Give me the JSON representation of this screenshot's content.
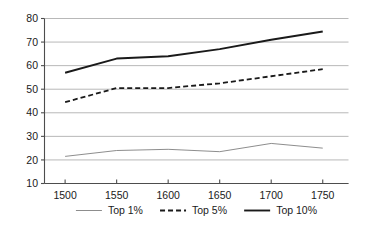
{
  "chart_data": {
    "type": "line",
    "title": "",
    "subtitle": "",
    "xlabel": "",
    "ylabel": "",
    "x": [
      1500,
      1550,
      1600,
      1650,
      1700,
      1750
    ],
    "categories": [
      "1500",
      "1550",
      "1600",
      "1650",
      "1700",
      "1750"
    ],
    "xlim": [
      1480,
      1775
    ],
    "ylim": [
      10,
      80
    ],
    "yticks": [
      10,
      20,
      30,
      40,
      50,
      60,
      70,
      80
    ],
    "ytick_labels": [
      "10",
      "20",
      "30",
      "40",
      "50",
      "60",
      "70",
      "80"
    ],
    "xticks": [
      1500,
      1550,
      1600,
      1650,
      1700,
      1750
    ],
    "xtick_labels": [
      "1500",
      "1550",
      "1600",
      "1650",
      "1700",
      "1750"
    ],
    "grid": "horizontal",
    "legend_position": "bottom",
    "series": [
      {
        "name": "Top 1%",
        "style": "solid-thin",
        "color": "#808080",
        "width": 0.9,
        "values": [
          21.5,
          24.0,
          24.5,
          23.5,
          27.0,
          25.0
        ]
      },
      {
        "name": "Top 5%",
        "style": "dashed",
        "color": "#1a1a1a",
        "width": 1.8,
        "dash": "5,3",
        "values": [
          44.5,
          50.5,
          50.5,
          52.5,
          55.5,
          58.5
        ]
      },
      {
        "name": "Top 10%",
        "style": "solid-thick",
        "color": "#1a1a1a",
        "width": 1.9,
        "values": [
          57.0,
          63.0,
          64.0,
          67.0,
          71.0,
          74.5
        ]
      }
    ]
  },
  "legend": {
    "items": [
      {
        "label": "Top 1%"
      },
      {
        "label": "Top 5%"
      },
      {
        "label": "Top 10%"
      }
    ]
  },
  "colors": {
    "axis": "#4d4d4d",
    "grid": "#a6a6a6",
    "text": "#1a1a1a",
    "background": "#ffffff"
  }
}
